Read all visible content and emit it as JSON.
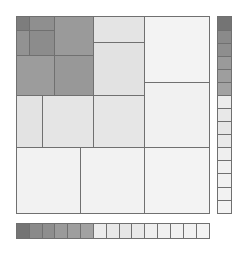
{
  "diagram": {
    "type": "treemap-grid",
    "main_area": {
      "x": 16,
      "y": 16,
      "w": 193,
      "h": 197
    },
    "cells": [
      {
        "id": "c1",
        "x": 16,
        "y": 16,
        "w": 13,
        "h": 14,
        "color": "#7d7d7d"
      },
      {
        "id": "c2",
        "x": 29,
        "y": 16,
        "w": 25,
        "h": 14,
        "color": "#8f8f8f"
      },
      {
        "id": "c3",
        "x": 16,
        "y": 30,
        "w": 13,
        "h": 25,
        "color": "#929292"
      },
      {
        "id": "c4",
        "x": 29,
        "y": 30,
        "w": 25,
        "h": 25,
        "color": "#8c8c8c"
      },
      {
        "id": "c5",
        "x": 54,
        "y": 16,
        "w": 39,
        "h": 39,
        "color": "#9a9a9a"
      },
      {
        "id": "c6",
        "x": 16,
        "y": 55,
        "w": 38,
        "h": 40,
        "color": "#9c9c9c"
      },
      {
        "id": "c7",
        "x": 54,
        "y": 55,
        "w": 39,
        "h": 40,
        "color": "#989898"
      },
      {
        "id": "c8",
        "x": 93,
        "y": 16,
        "w": 51,
        "h": 26,
        "color": "#e4e4e4"
      },
      {
        "id": "c9",
        "x": 93,
        "y": 42,
        "w": 51,
        "h": 53,
        "color": "#e2e2e2"
      },
      {
        "id": "c10",
        "x": 144,
        "y": 16,
        "w": 65,
        "h": 66,
        "color": "#f3f3f3"
      },
      {
        "id": "c11",
        "x": 144,
        "y": 82,
        "w": 65,
        "h": 65,
        "color": "#f1f1f1"
      },
      {
        "id": "c12",
        "x": 16,
        "y": 95,
        "w": 26,
        "h": 52,
        "color": "#e3e3e3"
      },
      {
        "id": "c13",
        "x": 42,
        "y": 95,
        "w": 51,
        "h": 52,
        "color": "#e5e5e5"
      },
      {
        "id": "c14",
        "x": 93,
        "y": 95,
        "w": 51,
        "h": 52,
        "color": "#e6e6e6"
      },
      {
        "id": "c15",
        "x": 16,
        "y": 147,
        "w": 64,
        "h": 66,
        "color": "#f2f2f2"
      },
      {
        "id": "c16",
        "x": 80,
        "y": 147,
        "w": 64,
        "h": 66,
        "color": "#f2f2f2"
      },
      {
        "id": "c17",
        "x": 144,
        "y": 147,
        "w": 65,
        "h": 66,
        "color": "#f3f3f3"
      }
    ],
    "right_legend": {
      "x": 217,
      "w": 14,
      "swatches": [
        {
          "y": 16,
          "h": 14,
          "color": "#747474"
        },
        {
          "y": 30,
          "h": 13,
          "color": "#8a8a8a"
        },
        {
          "y": 43,
          "h": 13,
          "color": "#8e8e8e"
        },
        {
          "y": 56,
          "h": 13,
          "color": "#9a9a9a"
        },
        {
          "y": 69,
          "h": 13,
          "color": "#9e9e9e"
        },
        {
          "y": 82,
          "h": 13,
          "color": "#a2a2a2"
        },
        {
          "y": 95,
          "h": 13,
          "color": "#ececec"
        },
        {
          "y": 108,
          "h": 13,
          "color": "#e8e8e8"
        },
        {
          "y": 121,
          "h": 13,
          "color": "#e6e6e6"
        },
        {
          "y": 134,
          "h": 13,
          "color": "#e9e9e9"
        },
        {
          "y": 147,
          "h": 13,
          "color": "#efefef"
        },
        {
          "y": 160,
          "h": 13,
          "color": "#f0f0f0"
        },
        {
          "y": 173,
          "h": 14,
          "color": "#f1f1f1"
        },
        {
          "y": 187,
          "h": 13,
          "color": "#f2f2f2"
        },
        {
          "y": 200,
          "h": 13,
          "color": "#f3f3f3"
        }
      ]
    },
    "bottom_legend": {
      "y": 223,
      "h": 15,
      "swatches": [
        {
          "x": 16,
          "w": 13,
          "color": "#747474"
        },
        {
          "x": 29,
          "w": 13,
          "color": "#8a8a8a"
        },
        {
          "x": 42,
          "w": 12,
          "color": "#8e8e8e"
        },
        {
          "x": 54,
          "w": 13,
          "color": "#9a9a9a"
        },
        {
          "x": 67,
          "w": 13,
          "color": "#9e9e9e"
        },
        {
          "x": 80,
          "w": 13,
          "color": "#a2a2a2"
        },
        {
          "x": 93,
          "w": 13,
          "color": "#ececec"
        },
        {
          "x": 106,
          "w": 13,
          "color": "#e8e8e8"
        },
        {
          "x": 119,
          "w": 12,
          "color": "#e6e6e6"
        },
        {
          "x": 131,
          "w": 13,
          "color": "#e9e9e9"
        },
        {
          "x": 144,
          "w": 13,
          "color": "#efefef"
        },
        {
          "x": 157,
          "w": 13,
          "color": "#f0f0f0"
        },
        {
          "x": 170,
          "w": 13,
          "color": "#f1f1f1"
        },
        {
          "x": 183,
          "w": 13,
          "color": "#f2f2f2"
        },
        {
          "x": 196,
          "w": 13,
          "color": "#f3f3f3"
        }
      ]
    },
    "border_color": "#707070"
  }
}
